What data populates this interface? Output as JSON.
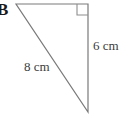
{
  "figure": {
    "name": "B",
    "shape": "right-triangle",
    "background_color": "#ffffff",
    "stroke_color": "#7a7a7a",
    "text_color": "#3b3b3b",
    "label_color": "#1a1a1a",
    "vertices": {
      "top_left": {
        "x": 16,
        "y": 4
      },
      "top_right": {
        "x": 88,
        "y": 4
      },
      "bottom_right": {
        "x": 88,
        "y": 112
      }
    },
    "right_angle_marker": {
      "corner": "top-right",
      "size": 11,
      "x": 77,
      "y": 4
    },
    "sides": [
      {
        "name": "vertical",
        "label": "6 cm",
        "from": "top_right",
        "to": "bottom_right"
      },
      {
        "name": "hypotenuse",
        "label": "8 cm",
        "from": "top_left",
        "to": "bottom_right"
      },
      {
        "name": "top",
        "label": "",
        "from": "top_left",
        "to": "top_right"
      }
    ]
  }
}
